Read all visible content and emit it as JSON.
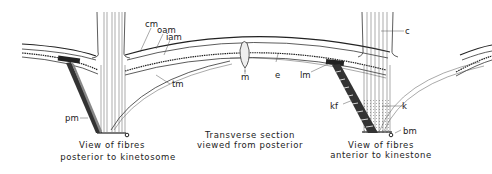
{
  "figure": {
    "title": "Transverse section viewed from posterior",
    "captions": {
      "left_line1": "View of fibres",
      "left_line2": "posterior to kinetosome",
      "center_line1": "Transverse section",
      "center_line2": "viewed from posterior",
      "right_line1": "View of fibres",
      "right_line2": "anterior to kinestone"
    },
    "labels": {
      "cm": "cm",
      "oam": "oam",
      "iam": "iam",
      "m": "m",
      "e": "e",
      "tm": "tm",
      "pm": "pm",
      "lm": "lm",
      "kf": "kf",
      "k": "k",
      "c": "c",
      "bm": "bm"
    },
    "colors": {
      "ink": "#222222",
      "background": "#ffffff"
    }
  }
}
